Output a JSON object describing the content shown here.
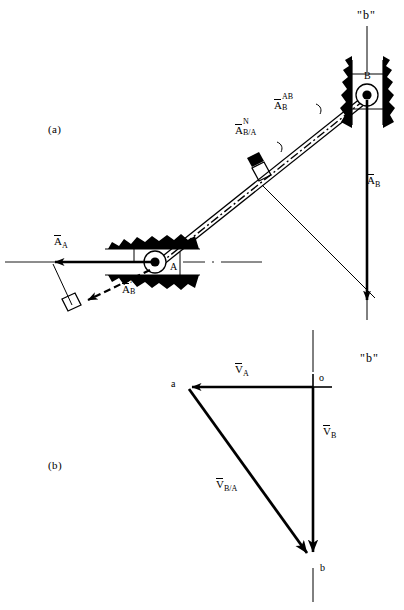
{
  "figure": {
    "panel_a_label": "(a)",
    "panel_b_label": "(b)"
  },
  "panel_a": {
    "title_label": "(a)",
    "path_label_top": "\"b\"",
    "joint_a_label": "A",
    "joint_b_label": "B",
    "vectors": [
      {
        "name": "accel-a",
        "symbol": "A",
        "sub": "A",
        "sup": "",
        "text": "A_A"
      },
      {
        "name": "accel-b",
        "symbol": "A",
        "sub": "B",
        "sup": "",
        "text": "A_B"
      },
      {
        "name": "accel-b-ab",
        "symbol": "A",
        "sub": "B",
        "sup": "AB",
        "text": "A_B^AB"
      },
      {
        "name": "accel-b-rel-a-normal",
        "symbol": "A",
        "sub": "B/A",
        "sup": "N",
        "text": "A_B/A^N"
      },
      {
        "name": "accel-b-ab-lower",
        "symbol": "A",
        "sub": "B",
        "sup": "AB",
        "text": "A_B^AB"
      }
    ]
  },
  "panel_b": {
    "title_label": "(b)",
    "path_label": "\"b\"",
    "points": [
      {
        "name": "pole-point-a",
        "label": "a"
      },
      {
        "name": "pole-point-o",
        "label": "o"
      },
      {
        "name": "pole-point-b",
        "label": "b"
      }
    ],
    "vectors": [
      {
        "name": "velocity-a",
        "symbol": "V",
        "sub": "A",
        "text": "V_A"
      },
      {
        "name": "velocity-b",
        "symbol": "V",
        "sub": "B",
        "text": "V_B"
      },
      {
        "name": "velocity-b-rel-a",
        "symbol": "V",
        "sub": "B/A",
        "text": "V_B/A"
      }
    ]
  },
  "colors": {
    "ink": "#000000",
    "paper": "#ffffff",
    "thin": "#1a1a1a"
  }
}
